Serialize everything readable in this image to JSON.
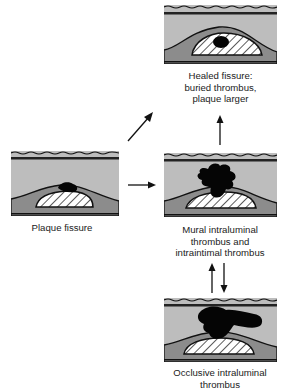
{
  "diagram": {
    "colors": {
      "lumen": "#bdbdbd",
      "wall": "#8c8c8c",
      "plaque_fill": "#ffffff",
      "hatch": "#333333",
      "thrombus": "#050505",
      "outline": "#111111"
    },
    "panels": [
      {
        "id": "plaque-fissure",
        "caption_lines": [
          "Plaque fissure"
        ]
      },
      {
        "id": "healed-fissure",
        "caption_lines": [
          "Healed fissure:",
          "buried thrombus,",
          "plaque larger"
        ]
      },
      {
        "id": "mural-thrombus",
        "caption_lines": [
          "Mural intraluminal",
          "thrombus and",
          "intraintimal thrombus"
        ]
      },
      {
        "id": "occlusive-thrombus",
        "caption_lines": [
          "Occlusive intraluminal",
          "thrombus"
        ]
      }
    ],
    "arrows": [
      {
        "from": "plaque-fissure",
        "to": "healed-fissure",
        "direction": "diagonal-up-right"
      },
      {
        "from": "plaque-fissure",
        "to": "mural-thrombus",
        "direction": "right"
      },
      {
        "from": "mural-thrombus",
        "to": "healed-fissure",
        "direction": "up"
      },
      {
        "from": "occlusive-thrombus",
        "to": "mural-thrombus",
        "direction": "up"
      },
      {
        "from": "mural-thrombus",
        "to": "occlusive-thrombus",
        "direction": "down"
      }
    ]
  }
}
